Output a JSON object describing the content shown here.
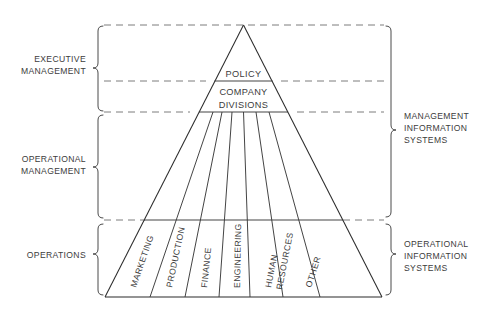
{
  "diagram": {
    "background_color": "#ffffff",
    "line_color": "#2b2b2b",
    "dashed_line_color": "#7d7d7d",
    "text_color": "#3c3c3c",
    "left_labels": [
      {
        "id": "executive-management",
        "lines": [
          "EXECUTIVE",
          "MANAGEMENT"
        ]
      },
      {
        "id": "operational-management",
        "lines": [
          "OPERATIONAL",
          "MANAGEMENT"
        ]
      },
      {
        "id": "operations",
        "lines": [
          "OPERATIONS"
        ]
      }
    ],
    "right_labels": [
      {
        "id": "management-information-systems",
        "lines": [
          "MANAGEMENT",
          "INFORMATION",
          "SYSTEMS"
        ]
      },
      {
        "id": "operational-information-systems",
        "lines": [
          "OPERATIONAL",
          "INFORMATION",
          "SYSTEMS"
        ]
      }
    ],
    "pyramid_tiers": [
      {
        "id": "policy",
        "lines": [
          "POLICY"
        ]
      },
      {
        "id": "company-divisions",
        "lines": [
          "COMPANY",
          "DIVISIONS"
        ]
      }
    ],
    "departments": [
      {
        "id": "marketing",
        "lines": [
          "MARKETING"
        ]
      },
      {
        "id": "production",
        "lines": [
          "PRODUCTION"
        ]
      },
      {
        "id": "finance",
        "lines": [
          "FINANCE"
        ]
      },
      {
        "id": "engineering",
        "lines": [
          "ENGINEERING"
        ]
      },
      {
        "id": "human-resources",
        "lines": [
          "HUMAN",
          "RESOURCES"
        ]
      },
      {
        "id": "other",
        "lines": [
          "OTHER"
        ]
      }
    ]
  }
}
